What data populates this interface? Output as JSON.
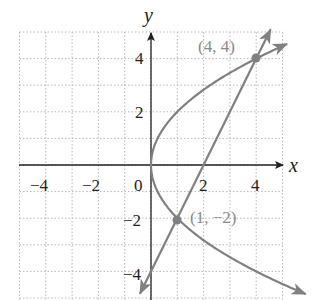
{
  "chart_data": {
    "type": "line",
    "title": "",
    "xlabel": "x",
    "ylabel": "y",
    "xlim": [
      -5,
      5
    ],
    "ylim": [
      -5,
      5
    ],
    "grid": true,
    "x_ticks": [
      -4,
      -2,
      0,
      2,
      4
    ],
    "y_ticks": [
      4,
      2,
      -2,
      -4
    ],
    "x_tick_labels": [
      "−4",
      "−2",
      "0",
      "2",
      "4"
    ],
    "y_tick_labels": [
      "4",
      "2",
      "−2",
      "−4"
    ],
    "series": [
      {
        "name": "parabola",
        "equation": "y^2 = 4x",
        "color": "#808080",
        "points": [
          [
            6.25,
            -5
          ],
          [
            4,
            -4
          ],
          [
            2.25,
            -3
          ],
          [
            1,
            -2
          ],
          [
            0.25,
            -1
          ],
          [
            0,
            0
          ],
          [
            0.25,
            1
          ],
          [
            1,
            2
          ],
          [
            2.25,
            3
          ],
          [
            4,
            4
          ],
          [
            5.06,
            4.5
          ]
        ]
      },
      {
        "name": "line",
        "equation": "y = 2x - 4",
        "color": "#808080",
        "points": [
          [
            -0.45,
            -4.9
          ],
          [
            4.5,
            5
          ]
        ]
      }
    ],
    "annotations": [
      {
        "label": "(4, 4)",
        "x": 4,
        "y": 4
      },
      {
        "label": "(1, −2)",
        "x": 1,
        "y": -2
      }
    ]
  },
  "labels": {
    "x_axis": "x",
    "y_axis": "y",
    "point_a": "(4, 4)",
    "point_b": "(1, −2)",
    "xt0": "−4",
    "xt1": "−2",
    "xt2": "0",
    "xt3": "2",
    "xt4": "4",
    "yt0": "4",
    "yt1": "2",
    "yt2": "−2",
    "yt3": "−4"
  }
}
